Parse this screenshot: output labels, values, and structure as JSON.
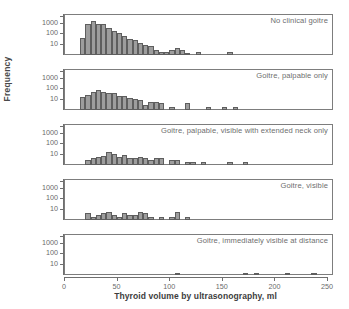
{
  "chart_data": {
    "type": "bar",
    "title": "",
    "xlabel": "Thyroid volume by ultrasonography, ml",
    "ylabel": "Frequency",
    "yscale": "log",
    "ylim": [
      1,
      4000
    ],
    "yticks": [
      10,
      100,
      1000
    ],
    "ytick_labels": [
      "10",
      "100",
      "1000"
    ],
    "xlim": [
      -7,
      258
    ],
    "xticks": [
      0,
      50,
      100,
      150,
      200,
      250
    ],
    "xtick_labels": [
      "0",
      "50",
      "100",
      "150",
      "200",
      "250"
    ],
    "grid": false,
    "legend": "none",
    "bin_width": 5,
    "bar_color": "#9d9d9d",
    "bar_edge_color": "#5e5e5e",
    "panels": [
      {
        "label": "No clinical goitre",
        "bins": [
          5,
          10,
          15,
          20,
          25,
          30,
          35,
          40,
          45,
          50,
          55,
          60,
          65,
          70,
          75,
          80,
          85,
          90,
          95,
          100,
          105,
          115,
          145
        ],
        "values": [
          40,
          800,
          1500,
          800,
          700,
          330,
          160,
          100,
          55,
          33,
          22,
          13,
          9,
          7,
          3,
          2,
          2,
          3,
          4,
          3,
          1,
          2,
          2
        ]
      },
      {
        "label": "Goitre, palpable only",
        "bins": [
          5,
          10,
          15,
          20,
          25,
          30,
          35,
          40,
          45,
          50,
          55,
          60,
          65,
          70,
          75,
          80,
          90,
          105,
          125,
          140,
          150
        ],
        "values": [
          15,
          22,
          45,
          70,
          45,
          40,
          35,
          20,
          18,
          13,
          11,
          9,
          3,
          6,
          6,
          4,
          2,
          4,
          2,
          2,
          2
        ]
      },
      {
        "label": "Goitre, palpable, visible with extended neck only",
        "bins": [
          10,
          15,
          20,
          25,
          30,
          35,
          40,
          45,
          50,
          55,
          60,
          65,
          70,
          75,
          80,
          90,
          95,
          105,
          110,
          120,
          145,
          160
        ],
        "values": [
          3,
          4,
          6,
          7,
          15,
          11,
          5,
          9,
          4,
          4,
          5,
          4,
          3,
          4,
          4,
          3,
          3,
          2,
          2,
          2,
          2,
          2
        ]
      },
      {
        "label": "Goitre, visible",
        "bins": [
          10,
          15,
          20,
          25,
          30,
          35,
          40,
          45,
          50,
          55,
          60,
          65,
          70,
          80,
          90,
          95,
          105
        ],
        "values": [
          4,
          2,
          3,
          4,
          5,
          3,
          2,
          4,
          3,
          3,
          5,
          4,
          2,
          2,
          2,
          5,
          2
        ]
      },
      {
        "label": "Goitre, immediately visible at distance",
        "bins": [
          95,
          160,
          170,
          200,
          225
        ],
        "values": [
          1,
          1,
          1,
          1,
          1
        ]
      }
    ]
  }
}
